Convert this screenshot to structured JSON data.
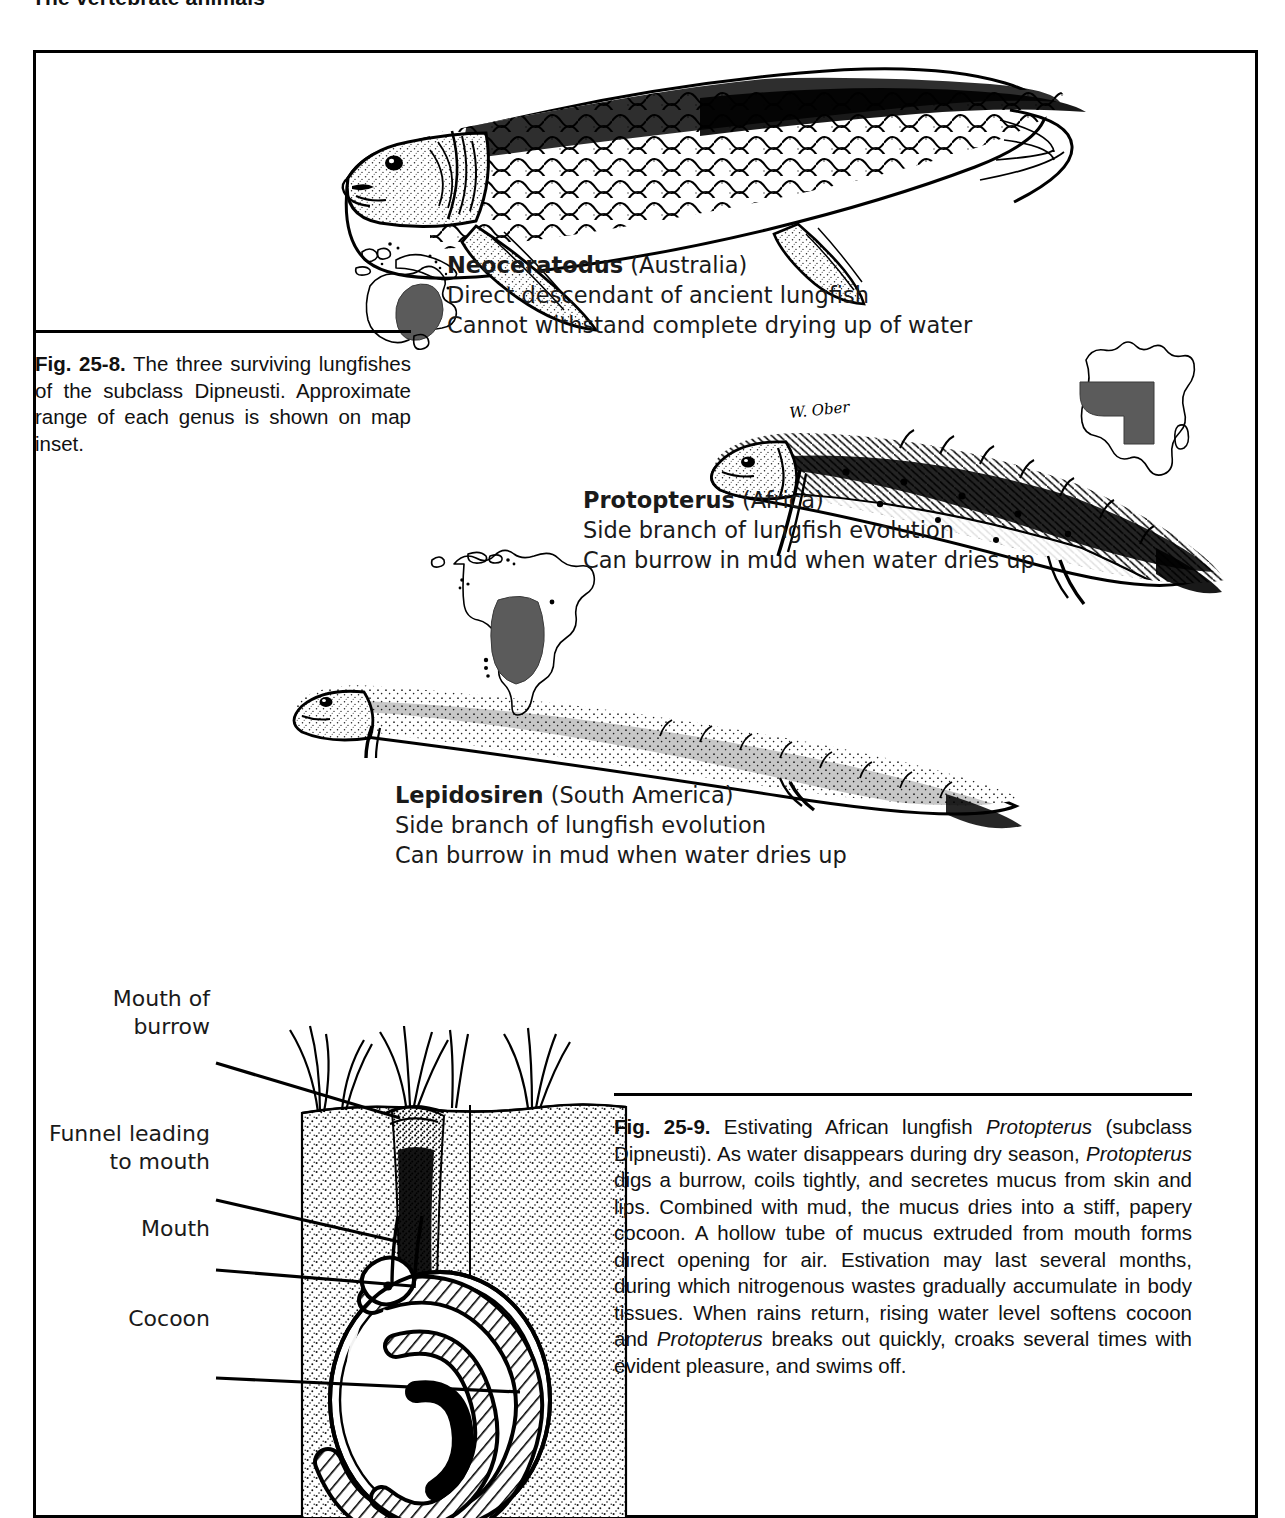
{
  "running_head": "The vertebrate animals",
  "figures": [
    {
      "id": "fig-25-8",
      "caption": {
        "number": "Fig. 25-8.",
        "text": " The three surviving lungfishes of the subclass Dipneusti. Approximate range of each genus is shown on map inset."
      },
      "species": [
        {
          "genus": "Neoceratodus",
          "region": "(Australia)",
          "line2": "Direct descendant of ancient lungfish",
          "line3": "Cannot withstand complete drying up of water",
          "map": "australia-map-inset"
        },
        {
          "genus": "Protopterus",
          "region": "(Africa)",
          "line2": "Side branch of lungfish evolution",
          "line3": "Can burrow in mud when water dries up",
          "map": "africa-map-inset"
        },
        {
          "genus": "Lepidosiren",
          "region": "(South America)",
          "line2": "Side branch of lungfish evolution",
          "line3": "Can burrow in mud when water dries up",
          "map": "south-america-map-inset"
        }
      ],
      "artist_signature": "W. Ober"
    },
    {
      "id": "fig-25-9",
      "caption": {
        "number": "Fig. 25-9.",
        "part1": " Estivating African lungfish ",
        "italic1": "Protopterus",
        "part2": " (subclass Dipneusti). As water disappears during dry season, ",
        "italic2": "Protopterus",
        "part3": " digs a burrow, coils tightly, and secretes mucus from skin and lips. Combined with mud, the mucus dries into a stiff, papery cocoon. A hollow tube of mucus extruded from mouth forms direct opening for air. Estivation may last several months, during which nitrogenous wastes gradually accumulate in body tissues. When rains return, rising water level softens cocoon and ",
        "italic3": "Protopterus",
        "part4": " breaks out quickly, croaks several times with evident pleasure, and swims off."
      },
      "callouts": [
        {
          "id": "mouth-of-burrow",
          "line1": "Mouth of",
          "line2": "burrow"
        },
        {
          "id": "funnel-leading-to-mouth",
          "line1": "Funnel leading",
          "line2": "to mouth"
        },
        {
          "id": "mouth",
          "line1": "Mouth",
          "line2": ""
        },
        {
          "id": "cocoon",
          "line1": "Cocoon",
          "line2": ""
        }
      ]
    }
  ],
  "colors": {
    "ink": "#000000",
    "paper": "#ffffff",
    "map_range_fill": "#5b5b5b",
    "text": "#1a1a1a"
  }
}
